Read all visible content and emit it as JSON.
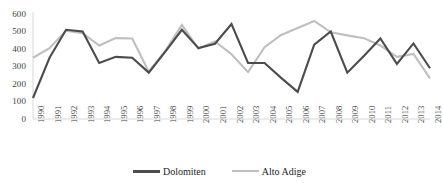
{
  "chart_data": {
    "type": "line",
    "title": "",
    "subtitle": "",
    "xlabel": "",
    "ylabel": "",
    "ylim": [
      0,
      600
    ],
    "yticks": [
      0,
      100,
      200,
      300,
      400,
      500,
      600
    ],
    "ytick_labels": [
      "0",
      "100",
      "200",
      "300",
      "400",
      "500",
      "600"
    ],
    "grid": false,
    "legend_position": "bottom-center",
    "categories": [
      "1990",
      "1991",
      "1992",
      "1993",
      "1994",
      "1995",
      "1996",
      "1997",
      "1998",
      "1999",
      "2000",
      "2001",
      "2002",
      "2003",
      "2004",
      "2005",
      "2006",
      "2007",
      "2008",
      "2009",
      "2010",
      "2011",
      "2012",
      "2013",
      "2014"
    ],
    "x": [
      1990,
      1991,
      1992,
      1993,
      1994,
      1995,
      1996,
      1997,
      1998,
      1999,
      2000,
      2001,
      2002,
      2003,
      2004,
      2005,
      2006,
      2007,
      2008,
      2009,
      2010,
      2011,
      2012,
      2013,
      2014
    ],
    "series": [
      {
        "name": "Dolomiten",
        "color": "#4c4c4c",
        "line_width": 2.1,
        "values": [
          120,
          350,
          510,
          500,
          320,
          355,
          350,
          265,
          385,
          510,
          405,
          430,
          543,
          320,
          320,
          235,
          155,
          425,
          500,
          265,
          360,
          460,
          315,
          432,
          290
        ]
      },
      {
        "name": "Alto Adige",
        "color": "#bfbfbf",
        "line_width": 2.1,
        "values": [
          350,
          405,
          505,
          490,
          420,
          462,
          460,
          270,
          390,
          538,
          402,
          443,
          370,
          268,
          410,
          480,
          520,
          560,
          495,
          478,
          462,
          420,
          355,
          372,
          232
        ]
      }
    ]
  },
  "axis": {
    "y_axis_line_color": "#d9d9d9",
    "x_axis_line_color": "#d9d9d9",
    "tick_text_color": "#3f3f3f"
  },
  "legend": {
    "entries": [
      {
        "label": "Dolomiten",
        "color": "#4c4c4c",
        "swatch": "thick-line-swatch"
      },
      {
        "label": "Alto Adige",
        "color": "#bfbfbf",
        "swatch": "thin-line-swatch"
      }
    ]
  }
}
